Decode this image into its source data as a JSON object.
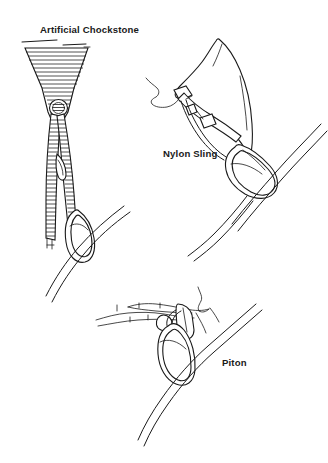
{
  "figure": {
    "background_color": "#ffffff",
    "ink_color": "#1a1a1a",
    "style": "black-and-white technical line drawing",
    "width": 328,
    "height": 463
  },
  "labels": {
    "chockstone": "Artificial Chockstone",
    "nylon_sling": "Nylon Sling",
    "piton": "Piton"
  },
  "panels": [
    {
      "id": "artificial-chockstone",
      "label": "Artificial Chockstone",
      "label_x": 40,
      "label_y": 33,
      "description": "Tapered wedge-shaped chock with horizontal hatching jammed in a crack, threaded with webbing sling running down to a carabiner with rope",
      "components": [
        "wedge-chock",
        "hatched-webbing-sling",
        "carabiner",
        "rope"
      ]
    },
    {
      "id": "nylon-sling",
      "label": "Nylon Sling",
      "label_x": 163,
      "label_y": 157,
      "description": "Nylon webbing sling looped around a natural rock horn with a carabiner and rope clipped through",
      "components": [
        "rock-horn",
        "nylon-webbing-sling",
        "carabiner",
        "rope"
      ]
    },
    {
      "id": "piton",
      "label": "Piton",
      "label_x": 222,
      "label_y": 366,
      "description": "Piton hammered into a horizontal crack with a carabiner clipped through its eye and rope running through",
      "components": [
        "rock-crack",
        "piton-blade",
        "piton-eye",
        "carabiner",
        "rope"
      ]
    }
  ]
}
